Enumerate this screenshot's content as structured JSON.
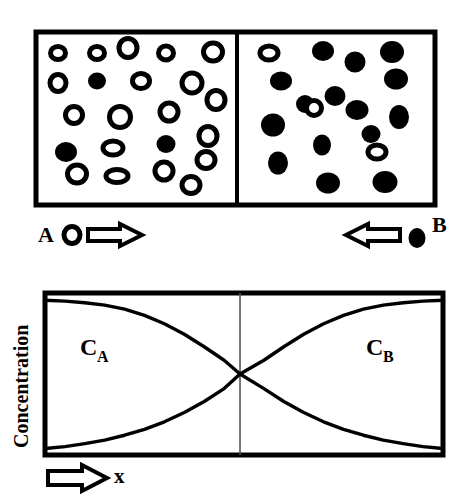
{
  "figure": {
    "background": "#ffffff",
    "ink_color": "#000000"
  },
  "diffusion_couple": {
    "name": "diffusion-couple-diagram",
    "left_cell": {
      "label": "A",
      "particle_style": "open-circle",
      "open_count": 22,
      "filled_count": 3,
      "open_particles": [
        {
          "cx": 58,
          "cy": 53,
          "rx": 7.5,
          "ry": 6.5
        },
        {
          "cx": 97,
          "cy": 53,
          "rx": 7.5,
          "ry": 6.5
        },
        {
          "cx": 128,
          "cy": 48,
          "rx": 9.0,
          "ry": 9.5
        },
        {
          "cx": 166,
          "cy": 53,
          "rx": 7.5,
          "ry": 7.0
        },
        {
          "cx": 213,
          "cy": 52,
          "rx": 9.5,
          "ry": 9.0
        },
        {
          "cx": 58,
          "cy": 83,
          "rx": 8.0,
          "ry": 8.5
        },
        {
          "cx": 141,
          "cy": 81,
          "rx": 8.5,
          "ry": 7.5
        },
        {
          "cx": 192,
          "cy": 83,
          "rx": 10.0,
          "ry": 10.0
        },
        {
          "cx": 216,
          "cy": 100,
          "rx": 9.0,
          "ry": 9.5
        },
        {
          "cx": 74,
          "cy": 115,
          "rx": 8.5,
          "ry": 8.5
        },
        {
          "cx": 120,
          "cy": 117,
          "rx": 10.5,
          "ry": 10.5
        },
        {
          "cx": 169,
          "cy": 112,
          "rx": 9.0,
          "ry": 9.0
        },
        {
          "cx": 208,
          "cy": 136,
          "rx": 9.0,
          "ry": 9.5
        },
        {
          "cx": 113,
          "cy": 148,
          "rx": 10.0,
          "ry": 7.0
        },
        {
          "cx": 206,
          "cy": 160,
          "rx": 9.0,
          "ry": 8.5
        },
        {
          "cx": 77,
          "cy": 174,
          "rx": 9.5,
          "ry": 9.0
        },
        {
          "cx": 117,
          "cy": 176,
          "rx": 11.0,
          "ry": 6.5
        },
        {
          "cx": 164,
          "cy": 171,
          "rx": 9.0,
          "ry": 9.0
        },
        {
          "cx": 191,
          "cy": 185,
          "rx": 9.0,
          "ry": 8.5
        }
      ],
      "filled_particles": [
        {
          "cx": 97,
          "cy": 81,
          "rx": 9.0,
          "ry": 8.5
        },
        {
          "cx": 66,
          "cy": 152,
          "rx": 11.0,
          "ry": 10.0
        },
        {
          "cx": 166,
          "cy": 144,
          "rx": 9.5,
          "ry": 9.0
        }
      ]
    },
    "right_cell": {
      "label": "B",
      "particle_style": "filled-circle",
      "filled_count": 15,
      "open_count": 3,
      "filled_particles": [
        {
          "cx": 323,
          "cy": 51,
          "rx": 11.0,
          "ry": 10.0
        },
        {
          "cx": 355,
          "cy": 62,
          "rx": 10.5,
          "ry": 10.5
        },
        {
          "cx": 392,
          "cy": 52,
          "rx": 12.0,
          "ry": 11.0
        },
        {
          "cx": 281,
          "cy": 81,
          "rx": 11.0,
          "ry": 9.5
        },
        {
          "cx": 396,
          "cy": 79,
          "rx": 12.0,
          "ry": 10.5
        },
        {
          "cx": 335,
          "cy": 96,
          "rx": 10.5,
          "ry": 10.0
        },
        {
          "cx": 357,
          "cy": 110,
          "rx": 11.5,
          "ry": 10.0
        },
        {
          "cx": 399,
          "cy": 117,
          "rx": 10.0,
          "ry": 12.0
        },
        {
          "cx": 273,
          "cy": 125,
          "rx": 12.0,
          "ry": 11.5
        },
        {
          "cx": 322,
          "cy": 145,
          "rx": 9.0,
          "ry": 10.5
        },
        {
          "cx": 278,
          "cy": 163,
          "rx": 10.0,
          "ry": 11.5
        },
        {
          "cx": 328,
          "cy": 183,
          "rx": 12.0,
          "ry": 10.5
        },
        {
          "cx": 385,
          "cy": 182,
          "rx": 12.5,
          "ry": 11.0
        },
        {
          "cx": 305,
          "cy": 104,
          "rx": 9.0,
          "ry": 9.0
        },
        {
          "cx": 371,
          "cy": 134,
          "rx": 9.5,
          "ry": 9.0
        }
      ],
      "open_particles": [
        {
          "cx": 269,
          "cy": 53,
          "rx": 9.0,
          "ry": 7.0
        },
        {
          "cx": 314,
          "cy": 108,
          "rx": 7.5,
          "ry": 7.5
        },
        {
          "cx": 377,
          "cy": 152,
          "rx": 9.0,
          "ry": 7.0
        }
      ]
    },
    "legend": {
      "left": {
        "label": "A",
        "marker": "open-circle",
        "arrow": "arrow-right"
      },
      "right": {
        "label": "B",
        "marker": "filled-circle",
        "arrow": "arrow-left"
      }
    }
  },
  "chart_data": {
    "type": "line",
    "title": "",
    "xlabel": "x",
    "ylabel": "Concentration",
    "grid": false,
    "legend_position": "inline-annotation",
    "xlim": [
      0,
      1
    ],
    "ylim": [
      0,
      1
    ],
    "axis_ticks": [],
    "annotations": [
      {
        "text": "C",
        "sub": "A",
        "x": 0.14,
        "y": 0.72
      },
      {
        "text": "C",
        "sub": "B",
        "x": 0.83,
        "y": 0.72
      }
    ],
    "interface_x": 0.49,
    "series": [
      {
        "name": "C_A",
        "label": "CA",
        "color": "#000000",
        "x": [
          0.0,
          0.05,
          0.1,
          0.15,
          0.2,
          0.25,
          0.3,
          0.35,
          0.4,
          0.45,
          0.49,
          0.55,
          0.6,
          0.65,
          0.7,
          0.75,
          0.8,
          0.85,
          0.9,
          0.95,
          1.0
        ],
        "y": [
          0.955,
          0.95,
          0.94,
          0.925,
          0.9,
          0.862,
          0.81,
          0.745,
          0.668,
          0.585,
          0.5,
          0.41,
          0.33,
          0.262,
          0.205,
          0.158,
          0.122,
          0.092,
          0.07,
          0.052,
          0.04
        ]
      },
      {
        "name": "C_B",
        "label": "CB",
        "color": "#000000",
        "x": [
          0.0,
          0.05,
          0.1,
          0.15,
          0.2,
          0.25,
          0.3,
          0.35,
          0.4,
          0.45,
          0.49,
          0.55,
          0.6,
          0.65,
          0.7,
          0.75,
          0.8,
          0.85,
          0.9,
          0.95,
          1.0
        ],
        "y": [
          0.04,
          0.052,
          0.07,
          0.092,
          0.122,
          0.158,
          0.205,
          0.262,
          0.33,
          0.41,
          0.5,
          0.585,
          0.668,
          0.745,
          0.81,
          0.862,
          0.9,
          0.925,
          0.94,
          0.95,
          0.955
        ]
      }
    ],
    "x_axis_arrow": "arrow-right"
  }
}
